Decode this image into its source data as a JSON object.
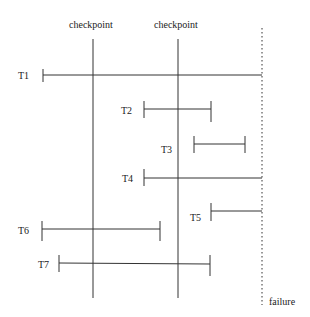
{
  "checkpoints": [
    {
      "label": "checkpoint",
      "x": 93
    },
    {
      "label": "checkpoint",
      "x": 178
    }
  ],
  "failure": {
    "label": "failure",
    "x": 262
  },
  "transactions": [
    {
      "label": "T1",
      "y": 75,
      "start": 43,
      "end": 262,
      "end_tick": false
    },
    {
      "label": "T2",
      "y": 109,
      "start": 144,
      "end": 211,
      "end_tick": true
    },
    {
      "label": "T3",
      "y": 144,
      "start": 194,
      "end": 245,
      "end_tick": true
    },
    {
      "label": "T4",
      "y": 178,
      "start": 144,
      "end": 262,
      "end_tick": false
    },
    {
      "label": "T5",
      "y": 211,
      "start": 211,
      "end": 262,
      "end_tick": false
    },
    {
      "label": "T6",
      "y": 229,
      "start": 42,
      "end": 160,
      "end_tick": true
    },
    {
      "label": "T7",
      "y": 264,
      "start": 59,
      "end": 210,
      "end_tick": true
    }
  ],
  "colors": {
    "line": "#333333"
  }
}
